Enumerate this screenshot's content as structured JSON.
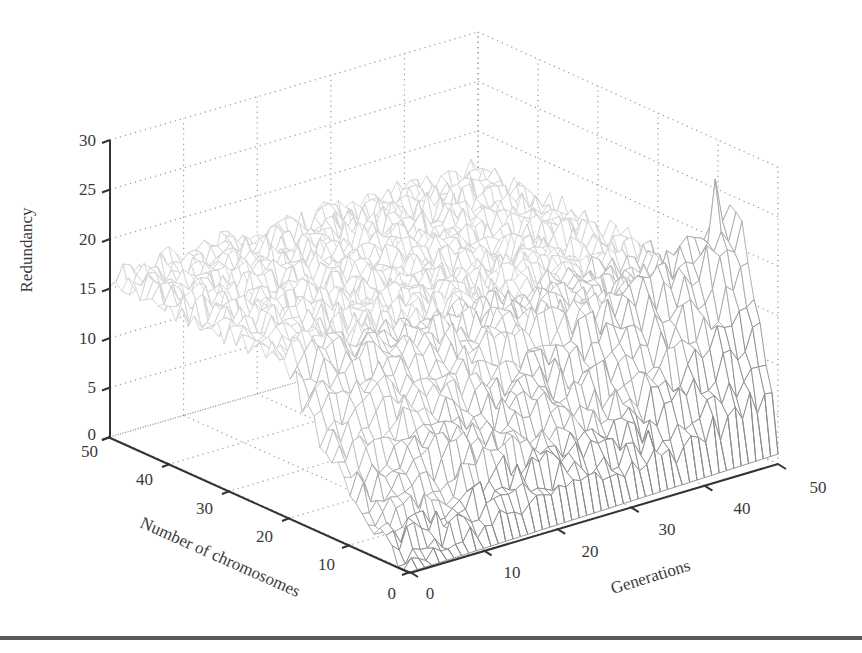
{
  "chart_data": {
    "type": "surface3d",
    "title": "",
    "xlabel": "Generations",
    "ylabel": "Number of chromosomes",
    "zlabel": "Redundancy",
    "x_ticks": [
      "0",
      "10",
      "20",
      "30",
      "40",
      "50"
    ],
    "y_ticks": [
      "0",
      "10",
      "20",
      "30",
      "40",
      "50"
    ],
    "z_ticks": [
      "0",
      "5",
      "10",
      "15",
      "20",
      "25",
      "30"
    ],
    "xlim": [
      0,
      50
    ],
    "ylim": [
      0,
      50
    ],
    "zlim": [
      0,
      30
    ],
    "grid": "dotted",
    "legend": null,
    "render": "wireframe mesh, light gray, darker toward front",
    "surface_profile": {
      "plateau_level": 16,
      "low_corner_level": 0,
      "peak": {
        "generation": 48,
        "chromosomes": 8,
        "redundancy": 27
      },
      "front_edge_rows": [
        {
          "chromosomes": 0,
          "redundancy_at_gen": {
            "0": 0,
            "10": 0.3,
            "20": 0.5,
            "30": 0.8,
            "40": 1.0,
            "50": 1.2
          }
        },
        {
          "chromosomes": 2,
          "redundancy_at_gen": {
            "0": 0,
            "10": 2,
            "20": 4,
            "30": 5,
            "40": 6,
            "50": 10
          }
        },
        {
          "chromosomes": 5,
          "redundancy_at_gen": {
            "0": 1,
            "10": 6,
            "20": 10,
            "30": 13,
            "40": 16,
            "50": 17
          }
        },
        {
          "chromosomes": 8,
          "redundancy_at_gen": {
            "0": 3,
            "10": 10,
            "20": 15,
            "30": 18,
            "40": 22,
            "50": 24
          }
        }
      ]
    }
  }
}
